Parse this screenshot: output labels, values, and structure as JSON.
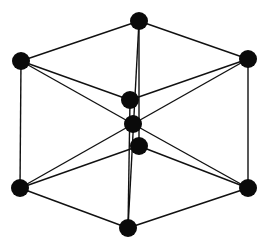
{
  "diagram": {
    "title": "",
    "type": "crystal-lattice-unit-cell",
    "colors": {
      "background": "#ffffff",
      "atom": "#0a0a0a",
      "bond": "#111111"
    },
    "atoms": [
      {
        "id": "top",
        "x": 139,
        "y": 21
      },
      {
        "id": "upper-left",
        "x": 21,
        "y": 61
      },
      {
        "id": "upper-right",
        "x": 248,
        "y": 59
      },
      {
        "id": "center-upper",
        "x": 130,
        "y": 100
      },
      {
        "id": "center",
        "x": 133,
        "y": 124
      },
      {
        "id": "center-lower",
        "x": 139,
        "y": 146
      },
      {
        "id": "lower-left",
        "x": 20,
        "y": 188
      },
      {
        "id": "lower-right",
        "x": 248,
        "y": 188
      },
      {
        "id": "bottom",
        "x": 128,
        "y": 228
      }
    ],
    "bonds": [
      [
        "top",
        "upper-left"
      ],
      [
        "top",
        "upper-right"
      ],
      [
        "upper-left",
        "lower-left"
      ],
      [
        "upper-right",
        "lower-right"
      ],
      [
        "lower-left",
        "bottom"
      ],
      [
        "lower-right",
        "bottom"
      ],
      [
        "upper-left",
        "center-upper"
      ],
      [
        "upper-right",
        "center-upper"
      ],
      [
        "upper-left",
        "center"
      ],
      [
        "upper-right",
        "center"
      ],
      [
        "lower-left",
        "center"
      ],
      [
        "lower-right",
        "center"
      ],
      [
        "lower-left",
        "center-lower"
      ],
      [
        "lower-right",
        "center-lower"
      ],
      [
        "top",
        "center-lower"
      ],
      [
        "top",
        "bottom"
      ],
      [
        "center-upper",
        "bottom"
      ]
    ]
  }
}
